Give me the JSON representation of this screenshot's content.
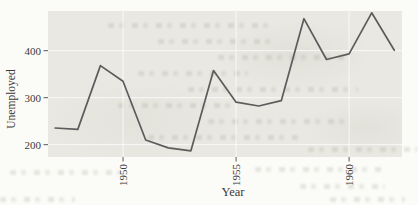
{
  "chart_data": {
    "type": "line",
    "title": "",
    "xlabel": "Year",
    "ylabel": "Unemployed",
    "x": [
      1947,
      1948,
      1949,
      1950,
      1951,
      1952,
      1953,
      1954,
      1955,
      1956,
      1957,
      1958,
      1959,
      1960,
      1961,
      1962
    ],
    "series": [
      {
        "name": "Unemployed",
        "values": [
          235.6,
          232.5,
          368.2,
          335.1,
          209.9,
          193.2,
          187.0,
          357.8,
          290.4,
          282.2,
          293.6,
          468.1,
          381.3,
          393.1,
          480.6,
          400.7
        ]
      }
    ],
    "x_ticks": [
      1950,
      1955,
      1960
    ],
    "y_ticks": [
      200,
      300,
      400
    ],
    "xlim": [
      1946.68,
      1962.34
    ],
    "ylim": [
      173.8,
      484.4
    ],
    "grid": {
      "major": true,
      "minor": false,
      "legend_position": "none"
    },
    "colors": {
      "line": "#5c5c5c",
      "panel": "#e9e8e2",
      "gridline": "rgba(255,255,255,0.75)",
      "tick": "#5a5a5a",
      "ink": "#3a3a3a",
      "paper": "#fbfbf8"
    }
  }
}
